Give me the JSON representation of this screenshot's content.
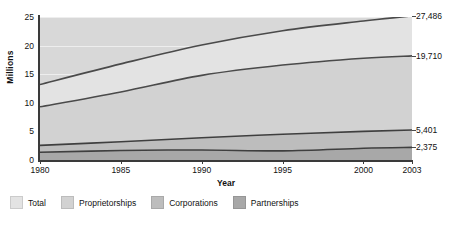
{
  "chart_data": {
    "type": "area",
    "title": "",
    "subtitle": "",
    "xlabel": "Year",
    "ylabel": "Millions",
    "x": [
      1980,
      1985,
      1990,
      1995,
      2000,
      2003
    ],
    "xlim": [
      1980,
      2003
    ],
    "ylim": [
      0,
      25
    ],
    "yticks": [
      0,
      5,
      10,
      15,
      20,
      25
    ],
    "xticks": [
      "1980",
      "1985",
      "1990",
      "1995",
      "2000",
      "2003"
    ],
    "ytick_labels": [
      "25",
      "20",
      "15",
      "10",
      "5",
      "0"
    ],
    "grid": true,
    "stacked": false,
    "legend_position": "bottom",
    "series": [
      {
        "name": "Total",
        "color": "#e3e3e3",
        "line_color": "#4a4a4a",
        "values": [
          13.2,
          16.8,
          20.1,
          22.6,
          24.3,
          25.2
        ],
        "end_label": "27,486"
      },
      {
        "name": "Proprietorships",
        "color": "#d2d2d2",
        "line_color": "#4a4a4a",
        "values": [
          9.3,
          11.9,
          14.8,
          16.6,
          17.8,
          18.2
        ],
        "end_label": "19,710"
      },
      {
        "name": "Corporations",
        "color": "#bdbdbd",
        "line_color": "#3f3f3f",
        "values": [
          2.55,
          3.2,
          3.9,
          4.5,
          5.0,
          5.25
        ],
        "end_label": "5,401"
      },
      {
        "name": "Partnerships",
        "color": "#a8a8a8",
        "line_color": "#3f3f3f",
        "values": [
          1.35,
          1.65,
          1.75,
          1.6,
          2.05,
          2.2
        ],
        "end_label": "2,375"
      }
    ],
    "end_labels": [
      "27,486",
      "19,710",
      "5,401",
      "2,375"
    ],
    "legend": [
      "Total",
      "Proprietorships",
      "Corporations",
      "Partnerships"
    ]
  },
  "legend": {
    "items": [
      {
        "label": "Total",
        "color": "#e3e3e3"
      },
      {
        "label": "Proprietorships",
        "color": "#d2d2d2"
      },
      {
        "label": "Corporations",
        "color": "#bdbdbd"
      },
      {
        "label": "Partnerships",
        "color": "#a8a8a8"
      }
    ]
  },
  "axes": {
    "x_title": "Year",
    "y_title": "Millions"
  }
}
